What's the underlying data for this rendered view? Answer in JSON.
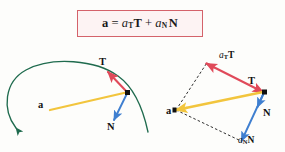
{
  "figure": {
    "background_color": "#fdfdfb",
    "title_formula": {
      "box_border_color": "#d4626a",
      "box_fill_color": "#fdf3f3",
      "lhs": "a",
      "equals": "=",
      "term1_scalar": "a",
      "term1_sub": "T",
      "term1_vector": "T",
      "plus": "+",
      "term2_scalar": "a",
      "term2_sub": "N",
      "term2_vector": "N"
    },
    "colors": {
      "curve_green": "#1f6b4e",
      "vector_a_yellow": "#f2c53d",
      "vector_T_red": "#e04a5a",
      "vector_N_blue": "#3f7fd0",
      "dashed_black": "#1a1a1a",
      "point_black": "#111111"
    },
    "left_panel": {
      "name": "curve-with-vectors",
      "curve_label": "trajectory-curve",
      "point_label": "particle-point",
      "labels": {
        "acceleration": "a",
        "tangent": "T",
        "normal": "N"
      }
    },
    "right_panel": {
      "name": "vector-decomposition-parallelogram",
      "labels": {
        "acceleration": "a",
        "tangent": "T",
        "normal": "N",
        "tangential_scalar": "a",
        "tangential_sub": "T",
        "tangential_vector": "T",
        "normal_scalar": "a",
        "normal_sub": "N",
        "normal_vector": "N"
      }
    }
  }
}
